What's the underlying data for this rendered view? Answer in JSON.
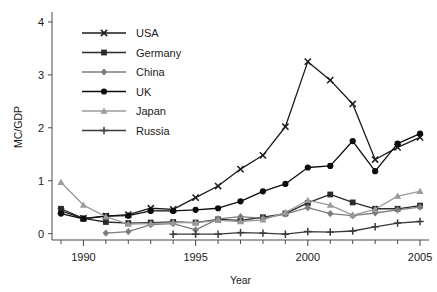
{
  "chart_data": {
    "type": "line",
    "title": "",
    "xlabel": "Year",
    "ylabel": "MC/GDP",
    "xlim": [
      1988.6,
      2005.4
    ],
    "ylim": [
      -0.12,
      4.15
    ],
    "xticks": [
      1990,
      1995,
      2000,
      2005
    ],
    "xtick_labels": [
      "1990",
      "1995",
      "2000",
      "2005"
    ],
    "yticks": [
      0,
      1,
      2,
      3,
      4
    ],
    "ytick_labels": [
      "0",
      "1",
      "2",
      "3",
      "4"
    ],
    "minor_xticks": [
      1989,
      1990,
      1991,
      1992,
      1993,
      1994,
      1995,
      1996,
      1997,
      1998,
      1999,
      2000,
      2001,
      2002,
      2003,
      2004,
      2005
    ],
    "grid": false,
    "legend_position": "upper-left",
    "x": [
      1989,
      1990,
      1991,
      1992,
      1993,
      1994,
      1995,
      1996,
      1997,
      1998,
      1999,
      2000,
      2001,
      2002,
      2003,
      2004,
      2005
    ],
    "series": [
      {
        "name": "USA",
        "marker": "x",
        "color": "#1a1a1a",
        "x": [
          1989,
          1990,
          1991,
          1992,
          1993,
          1994,
          1995,
          1996,
          1997,
          1998,
          1999,
          2000,
          2001,
          2002,
          2003,
          2004,
          2005
        ],
        "values": [
          0.43,
          0.29,
          0.33,
          0.36,
          0.48,
          0.46,
          0.68,
          0.9,
          1.22,
          1.48,
          2.02,
          3.25,
          2.9,
          2.45,
          1.4,
          1.63,
          1.82
        ]
      },
      {
        "name": "Germany",
        "marker": "square",
        "color": "#2b2b2b",
        "x": [
          1989,
          1990,
          1991,
          1992,
          1993,
          1994,
          1995,
          1996,
          1997,
          1998,
          1999,
          2000,
          2001,
          2002,
          2003,
          2004,
          2005
        ],
        "values": [
          0.47,
          0.29,
          0.22,
          0.2,
          0.21,
          0.22,
          0.21,
          0.27,
          0.25,
          0.31,
          0.38,
          0.58,
          0.74,
          0.59,
          0.47,
          0.47,
          0.53
        ]
      },
      {
        "name": "China",
        "marker": "diamond",
        "color": "#7d7d7d",
        "x": [
          1991,
          1992,
          1993,
          1994,
          1995,
          1996,
          1997,
          1998,
          1999,
          2000,
          2001,
          2002,
          2003,
          2004,
          2005
        ],
        "values": [
          0.01,
          0.04,
          0.17,
          0.19,
          0.07,
          0.28,
          0.32,
          0.29,
          0.37,
          0.49,
          0.38,
          0.34,
          0.39,
          0.45,
          0.5
        ]
      },
      {
        "name": "UK",
        "marker": "circle",
        "color": "#0d0d0d",
        "x": [
          1989,
          1990,
          1991,
          1992,
          1993,
          1994,
          1995,
          1996,
          1997,
          1998,
          1999,
          2000,
          2001,
          2002,
          2003,
          2004,
          2005
        ],
        "values": [
          0.38,
          0.28,
          0.33,
          0.34,
          0.43,
          0.43,
          0.45,
          0.48,
          0.61,
          0.8,
          0.94,
          1.25,
          1.28,
          1.75,
          1.18,
          1.7,
          1.89
        ]
      },
      {
        "name": "Japan",
        "marker": "triangle",
        "color": "#9a9a9a",
        "x": [
          1989,
          1990,
          1991,
          1992,
          1993,
          1994,
          1995,
          1996,
          1997,
          1998,
          1999,
          2000,
          2001,
          2002,
          2003,
          2004,
          2005
        ],
        "values": [
          0.97,
          0.54,
          0.32,
          0.18,
          0.19,
          0.21,
          0.21,
          0.25,
          0.23,
          0.26,
          0.4,
          0.63,
          0.54,
          0.35,
          0.46,
          0.71,
          0.8
        ]
      },
      {
        "name": "Russia",
        "marker": "plus",
        "color": "#3a3a3a",
        "x": [
          1994,
          1995,
          1996,
          1997,
          1998,
          1999,
          2000,
          2001,
          2002,
          2003,
          2004,
          2005
        ],
        "values": [
          -0.01,
          -0.01,
          -0.01,
          0.02,
          0.01,
          -0.01,
          0.04,
          0.03,
          0.05,
          0.13,
          0.2,
          0.23
        ]
      }
    ]
  },
  "legend": {
    "items": [
      {
        "label": "USA"
      },
      {
        "label": "Germany"
      },
      {
        "label": "China"
      },
      {
        "label": "UK"
      },
      {
        "label": "Japan"
      },
      {
        "label": "Russia"
      }
    ]
  }
}
